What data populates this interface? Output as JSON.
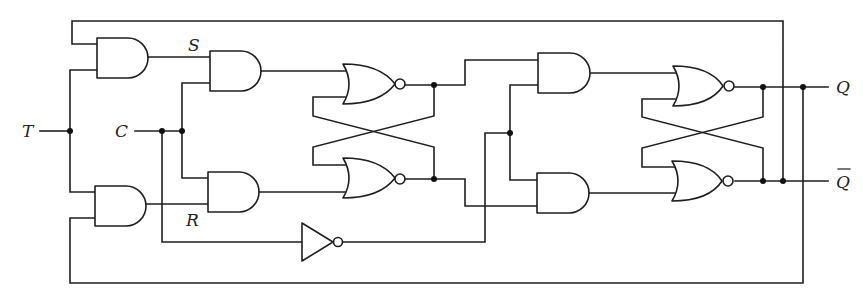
{
  "diagram": {
    "labels": {
      "T": "T",
      "C": "C",
      "S": "S",
      "R": "R",
      "Q": "Q",
      "Qbar": "Q"
    },
    "components": {
      "and_gates": 6,
      "nor_gates": 4,
      "inverters": 1
    },
    "colors": {
      "stroke": "#1e1e1e",
      "background": "#ffffff"
    }
  }
}
